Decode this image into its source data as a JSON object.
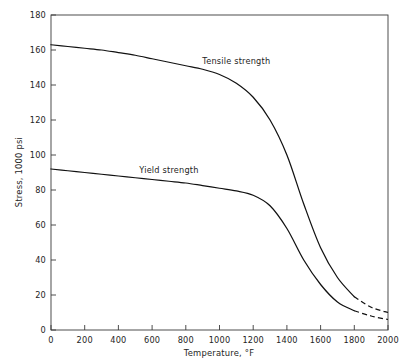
{
  "chart_data": {
    "type": "line",
    "title": "",
    "xlabel": "Temperature, °F",
    "ylabel": "Stress, 1000 psi",
    "xlim": [
      0,
      2000
    ],
    "ylim": [
      0,
      180
    ],
    "xticks": [
      0,
      200,
      400,
      600,
      800,
      1000,
      1200,
      1400,
      1600,
      1800,
      2000
    ],
    "yticks": [
      0,
      20,
      40,
      60,
      80,
      100,
      120,
      140,
      160,
      180
    ],
    "xtick_labels": [
      "0",
      "200",
      "400",
      "600",
      "800",
      "1000",
      "1200",
      "1400",
      "1600",
      "1800",
      "2000"
    ],
    "ytick_labels": [
      "0",
      "20",
      "40",
      "60",
      "80",
      "100",
      "120",
      "140",
      "160",
      "180"
    ],
    "grid": false,
    "legend_position": "inline-annotations",
    "series": [
      {
        "name": "Tensile strength",
        "label_text": "Tensile strength",
        "x": [
          0,
          100,
          200,
          300,
          400,
          500,
          600,
          700,
          800,
          900,
          1000,
          1100,
          1200,
          1300,
          1400,
          1500,
          1600,
          1700,
          1800,
          1900,
          2000
        ],
        "values": [
          163,
          162,
          161,
          160,
          158.5,
          157,
          155,
          153,
          151,
          149,
          146,
          141,
          133,
          120,
          100,
          72,
          47,
          30,
          19,
          13,
          10
        ],
        "dashed_from_x": 1800
      },
      {
        "name": "Yield strength",
        "label_text": "Yield strength",
        "x": [
          0,
          100,
          200,
          300,
          400,
          500,
          600,
          700,
          800,
          900,
          1000,
          1100,
          1200,
          1300,
          1400,
          1500,
          1600,
          1700,
          1800,
          1900,
          2000
        ],
        "values": [
          92,
          91,
          90,
          89,
          88,
          87,
          86,
          85,
          84,
          82.5,
          81,
          79.5,
          77,
          71,
          58,
          40,
          26,
          16,
          11,
          8,
          6
        ],
        "dashed_from_x": 1800
      }
    ],
    "annotations": [
      {
        "text": "Tensile strength",
        "x": 1100,
        "y": 152
      },
      {
        "text": "Yield strength",
        "x": 700,
        "y": 90
      }
    ]
  },
  "colors": {
    "curve": "#111111",
    "axis": "#3a3a3a",
    "background": "#ffffff",
    "text": "#242424"
  }
}
